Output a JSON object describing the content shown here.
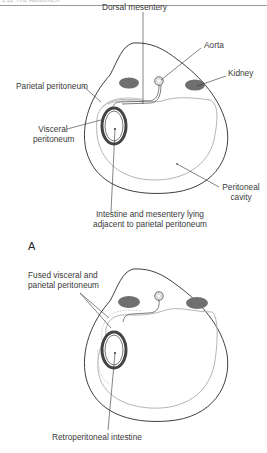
{
  "header": {
    "running_text": "212    The Abdomen"
  },
  "figure_a": {
    "panel_label": "A",
    "labels": {
      "dorsal_mesentery": "Dorsal mesentery",
      "aorta": "Aorta",
      "kidney": "Kidney",
      "parietal_peritoneum": "Parietal peritoneum",
      "visceral_peritoneum_1": "Visceral",
      "visceral_peritoneum_2": "peritoneum",
      "peritoneal_cavity_1": "Peritoneal",
      "peritoneal_cavity_2": "cavity",
      "intestine_1": "Intestine and mesentery lying",
      "intestine_2": "adjacent to parietal peritoneum"
    }
  },
  "figure_b": {
    "labels": {
      "fused_1": "Fused visceral and",
      "fused_2": "parietal peritoneum",
      "retroperitoneal": "Retroperitoneal intestine"
    }
  },
  "colors": {
    "outline": "#2a2a2a",
    "peritoneum": "#b5b5b5",
    "kidney_fill": "#6f6f6f",
    "intestine_wall": "#555555"
  }
}
